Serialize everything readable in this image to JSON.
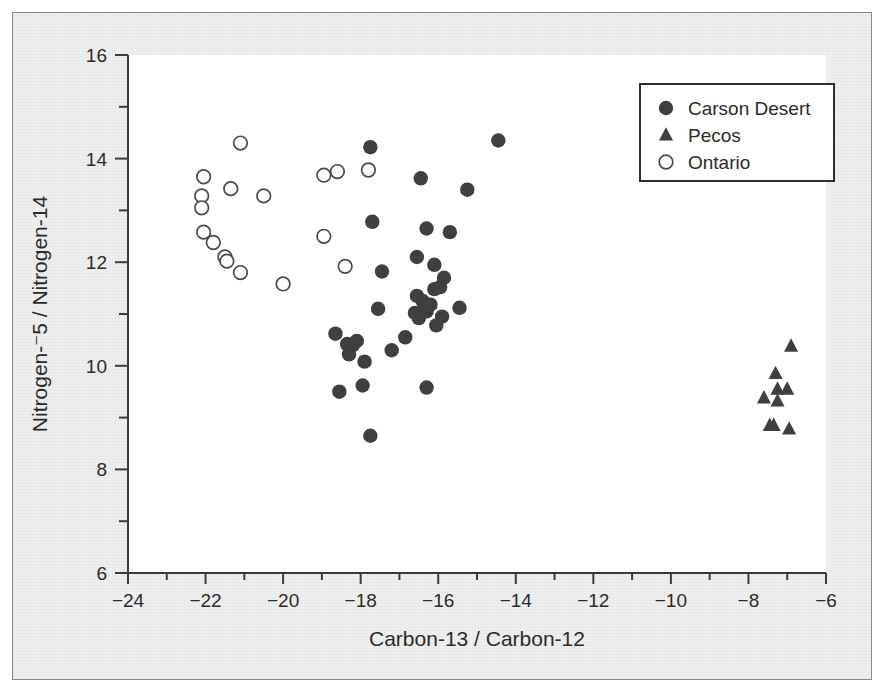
{
  "chart_data": {
    "type": "scatter",
    "title": "",
    "xlabel": "Carbon-13 / Carbon-12",
    "ylabel": "Nitrogen-⁻5 / Nitrogen-14",
    "xlim": [
      -24,
      -6
    ],
    "ylim": [
      6,
      16
    ],
    "xticks": [
      -24,
      -22,
      -20,
      -18,
      -16,
      -14,
      -12,
      -10,
      -8,
      -6
    ],
    "xticklabels": [
      "−24",
      "−22",
      "−20",
      "−18",
      "−16",
      "−14",
      "−12",
      "−10",
      "−8",
      "−6"
    ],
    "yticks": [
      6,
      8,
      10,
      12,
      14,
      16
    ],
    "yticklabels": [
      "6",
      "8",
      "10",
      "12",
      "14",
      "16"
    ],
    "x_minor_step": 1,
    "y_minor_step": 1,
    "grid": false,
    "legend_position": "upper-right",
    "series": [
      {
        "name": "Carson Desert",
        "marker": "filled-circle",
        "color": "#3f3f3f",
        "points": [
          [
            -17.75,
            14.22
          ],
          [
            -14.45,
            14.35
          ],
          [
            -16.45,
            13.62
          ],
          [
            -15.25,
            13.4
          ],
          [
            -17.7,
            12.78
          ],
          [
            -16.3,
            12.65
          ],
          [
            -15.7,
            12.58
          ],
          [
            -17.45,
            11.82
          ],
          [
            -16.55,
            12.1
          ],
          [
            -16.1,
            11.95
          ],
          [
            -15.85,
            11.7
          ],
          [
            -15.45,
            11.12
          ],
          [
            -16.55,
            11.35
          ],
          [
            -16.4,
            11.25
          ],
          [
            -16.35,
            11.12
          ],
          [
            -16.3,
            11.05
          ],
          [
            -16.2,
            11.18
          ],
          [
            -16.1,
            11.48
          ],
          [
            -15.95,
            11.52
          ],
          [
            -16.6,
            11.02
          ],
          [
            -16.5,
            10.92
          ],
          [
            -16.05,
            10.78
          ],
          [
            -15.9,
            10.95
          ],
          [
            -17.55,
            11.1
          ],
          [
            -17.2,
            10.3
          ],
          [
            -16.85,
            10.55
          ],
          [
            -18.65,
            10.62
          ],
          [
            -18.35,
            10.42
          ],
          [
            -18.2,
            10.4
          ],
          [
            -18.1,
            10.48
          ],
          [
            -18.3,
            10.22
          ],
          [
            -17.9,
            10.08
          ],
          [
            -18.55,
            9.5
          ],
          [
            -17.95,
            9.62
          ],
          [
            -16.3,
            9.58
          ],
          [
            -17.75,
            8.65
          ]
        ]
      },
      {
        "name": "Pecos",
        "marker": "filled-triangle",
        "color": "#3f3f3f",
        "points": [
          [
            -6.9,
            10.38
          ],
          [
            -7.3,
            9.85
          ],
          [
            -7.25,
            9.55
          ],
          [
            -7.0,
            9.55
          ],
          [
            -7.6,
            9.38
          ],
          [
            -7.25,
            9.32
          ],
          [
            -7.45,
            8.85
          ],
          [
            -7.35,
            8.85
          ],
          [
            -6.95,
            8.78
          ]
        ]
      },
      {
        "name": "Ontario",
        "marker": "open-circle",
        "color": "#4a4a4a",
        "points": [
          [
            -21.1,
            14.3
          ],
          [
            -22.05,
            13.65
          ],
          [
            -22.1,
            13.28
          ],
          [
            -22.1,
            13.05
          ],
          [
            -21.35,
            13.42
          ],
          [
            -20.5,
            13.28
          ],
          [
            -18.95,
            13.68
          ],
          [
            -18.6,
            13.75
          ],
          [
            -17.8,
            13.78
          ],
          [
            -22.05,
            12.58
          ],
          [
            -21.8,
            12.38
          ],
          [
            -21.5,
            12.1
          ],
          [
            -21.45,
            12.02
          ],
          [
            -21.1,
            11.8
          ],
          [
            -20.0,
            11.58
          ],
          [
            -18.95,
            12.5
          ],
          [
            -18.4,
            11.92
          ]
        ]
      }
    ]
  },
  "legend": {
    "items": [
      {
        "label": "Carson Desert",
        "marker": "filled-circle"
      },
      {
        "label": "Pecos",
        "marker": "filled-triangle"
      },
      {
        "label": "Ontario",
        "marker": "open-circle"
      }
    ]
  },
  "colors": {
    "marker_dark": "#3f3f3f",
    "marker_outline": "#4a4a4a",
    "axis": "#3b3b3b",
    "background": "#efefef",
    "plot_area": "#ffffff"
  }
}
